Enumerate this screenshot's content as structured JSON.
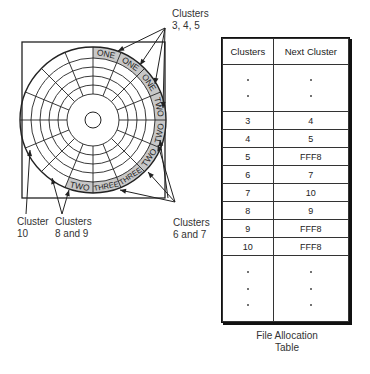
{
  "disk": {
    "sector_labels": [
      {
        "text": "ONE",
        "sector": 0
      },
      {
        "text": "ONE",
        "sector": 1
      },
      {
        "text": "ONE",
        "sector": 2
      },
      {
        "text": "TWO",
        "sector": 3
      },
      {
        "text": "TWO",
        "sector": 4
      },
      {
        "text": "TWO",
        "sector": 5
      },
      {
        "text": "THREE",
        "sector": 6
      },
      {
        "text": "THREE",
        "sector": 7
      },
      {
        "text": "TWO",
        "sector": 8
      }
    ]
  },
  "callouts": {
    "clusters_345": "Clusters\n3, 4, 5",
    "clusters_67": "Clusters\n6 and 7",
    "cluster_10": "Cluster\n10",
    "clusters_89": "Clusters\n8 and 9"
  },
  "fat": {
    "headers": [
      "Clusters",
      "Next Cluster"
    ],
    "rows": [
      {
        "cluster": "3",
        "next": "4"
      },
      {
        "cluster": "4",
        "next": "5"
      },
      {
        "cluster": "5",
        "next": "FFF8"
      },
      {
        "cluster": "6",
        "next": "7"
      },
      {
        "cluster": "7",
        "next": "10"
      },
      {
        "cluster": "8",
        "next": "9"
      },
      {
        "cluster": "9",
        "next": "FFF8"
      },
      {
        "cluster": "10",
        "next": "FFF8"
      }
    ],
    "caption": "File Allocation\nTable"
  },
  "colors": {
    "shaded_sector": "#c8c8c8",
    "line": "#222222"
  }
}
